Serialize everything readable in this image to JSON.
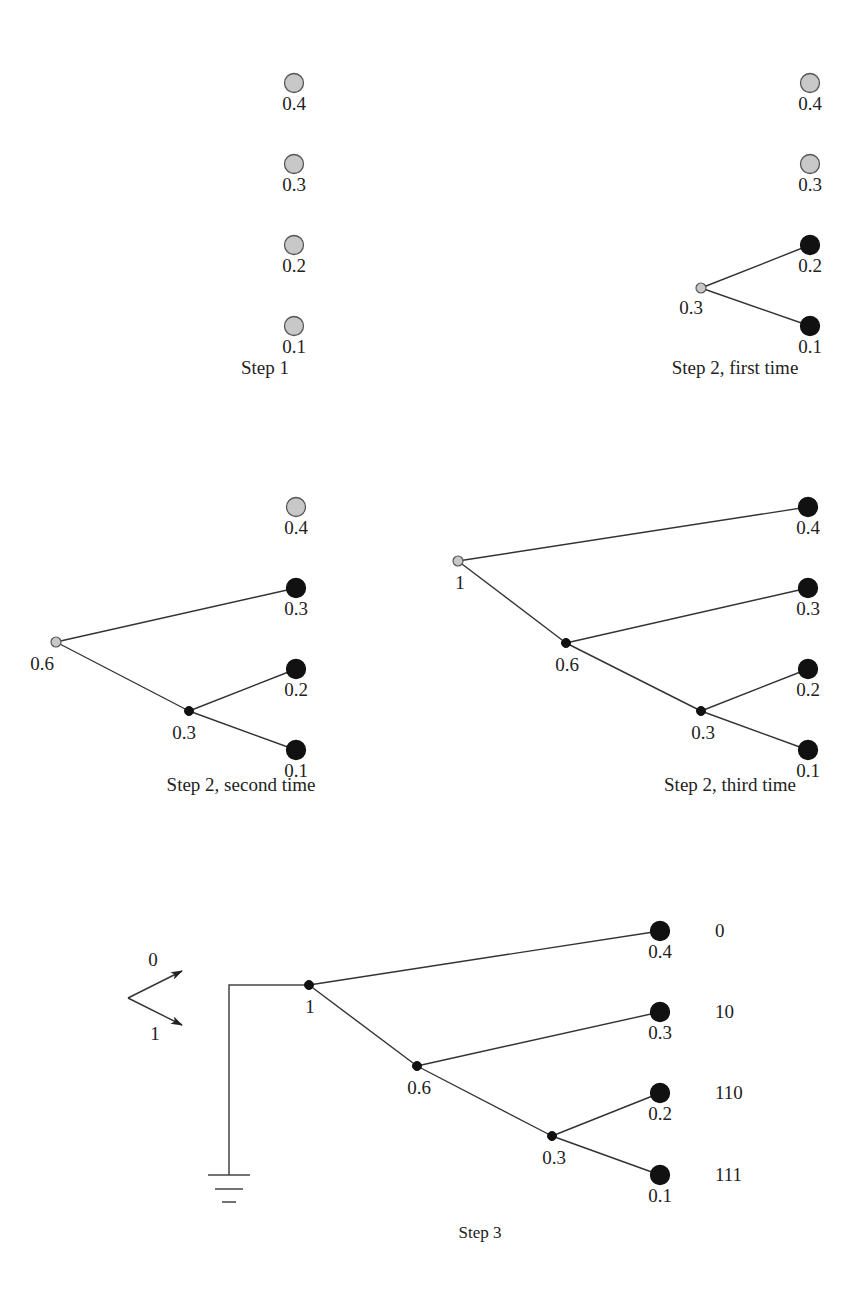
{
  "colors": {
    "pending_fill": "#c8c8c8",
    "pending_stroke": "#555555",
    "done_fill": "#111111",
    "line": "#333333",
    "text": "#222222"
  },
  "header_fragment": "",
  "panels": [
    {
      "id": "step1",
      "caption": "Step 1",
      "caption_pos": [
        265,
        374
      ],
      "leaves": [
        {
          "value": "0.4",
          "x": 294,
          "y": 83,
          "state": "pending"
        },
        {
          "value": "0.3",
          "x": 294,
          "y": 164,
          "state": "pending"
        },
        {
          "value": "0.2",
          "x": 294,
          "y": 245,
          "state": "pending"
        },
        {
          "value": "0.1",
          "x": 294,
          "y": 326,
          "state": "pending"
        }
      ],
      "internal": [],
      "edges": []
    },
    {
      "id": "step2-first",
      "caption": "Step 2, first time",
      "caption_pos": [
        735,
        374
      ],
      "leaves": [
        {
          "value": "0.4",
          "x": 810,
          "y": 83,
          "state": "pending"
        },
        {
          "value": "0.3",
          "x": 810,
          "y": 164,
          "state": "pending"
        },
        {
          "value": "0.2",
          "x": 810,
          "y": 245,
          "state": "done"
        },
        {
          "value": "0.1",
          "x": 810,
          "y": 326,
          "state": "done"
        }
      ],
      "internal": [
        {
          "value": "0.3",
          "x": 701,
          "y": 288,
          "state": "pending",
          "label_dx": -10,
          "label_dy": 26
        }
      ],
      "edges": [
        [
          701,
          288,
          810,
          245
        ],
        [
          701,
          288,
          810,
          326
        ]
      ]
    },
    {
      "id": "step2-second",
      "caption": "Step 2, second time",
      "caption_pos": [
        241,
        791
      ],
      "leaves": [
        {
          "value": "0.4",
          "x": 296,
          "y": 507,
          "state": "pending"
        },
        {
          "value": "0.3",
          "x": 296,
          "y": 588,
          "state": "done"
        },
        {
          "value": "0.2",
          "x": 296,
          "y": 669,
          "state": "done"
        },
        {
          "value": "0.1",
          "x": 296,
          "y": 750,
          "state": "done"
        }
      ],
      "internal": [
        {
          "value": "0.6",
          "x": 56,
          "y": 642,
          "state": "pending",
          "label_dx": -14,
          "label_dy": 28
        },
        {
          "value": "0.3",
          "x": 189,
          "y": 711,
          "state": "done",
          "label_dx": -5,
          "label_dy": 28
        }
      ],
      "edges": [
        [
          56,
          642,
          296,
          588
        ],
        [
          56,
          642,
          189,
          711
        ],
        [
          189,
          711,
          296,
          669
        ],
        [
          189,
          711,
          296,
          750
        ]
      ]
    },
    {
      "id": "step2-third",
      "caption": "Step 2, third time",
      "caption_pos": [
        730,
        791
      ],
      "leaves": [
        {
          "value": "0.4",
          "x": 808,
          "y": 507,
          "state": "done"
        },
        {
          "value": "0.3",
          "x": 808,
          "y": 588,
          "state": "done"
        },
        {
          "value": "0.2",
          "x": 808,
          "y": 669,
          "state": "done"
        },
        {
          "value": "0.1",
          "x": 808,
          "y": 750,
          "state": "done"
        }
      ],
      "internal": [
        {
          "value": "1",
          "x": 458,
          "y": 561,
          "state": "pending",
          "label_dx": 2,
          "label_dy": 28
        },
        {
          "value": "0.6",
          "x": 566,
          "y": 643,
          "state": "done",
          "label_dx": 1,
          "label_dy": 28
        },
        {
          "value": "0.3",
          "x": 701,
          "y": 711,
          "state": "done",
          "label_dx": 2,
          "label_dy": 28
        }
      ],
      "edges": [
        [
          458,
          561,
          808,
          507
        ],
        [
          458,
          561,
          566,
          643
        ],
        [
          566,
          643,
          808,
          588
        ],
        [
          566,
          643,
          701,
          711
        ],
        [
          701,
          711,
          808,
          669
        ],
        [
          701,
          711,
          808,
          750
        ]
      ]
    },
    {
      "id": "step3",
      "caption": "Step 3",
      "caption_pos": [
        480,
        1238
      ],
      "leaves": [
        {
          "value": "0.4",
          "x": 660,
          "y": 931,
          "state": "done",
          "code": "0"
        },
        {
          "value": "0.3",
          "x": 660,
          "y": 1012,
          "state": "done",
          "code": "10"
        },
        {
          "value": "0.2",
          "x": 660,
          "y": 1093,
          "state": "done",
          "code": "110"
        },
        {
          "value": "0.1",
          "x": 660,
          "y": 1175,
          "state": "done",
          "code": "111"
        }
      ],
      "internal": [
        {
          "value": "1",
          "x": 309,
          "y": 985,
          "state": "done",
          "label_dx": 1,
          "label_dy": 28
        },
        {
          "value": "0.6",
          "x": 417,
          "y": 1066,
          "state": "done",
          "label_dx": 2,
          "label_dy": 28
        },
        {
          "value": "0.3",
          "x": 552,
          "y": 1136,
          "state": "done",
          "label_dx": 2,
          "label_dy": 28
        }
      ],
      "edges": [
        [
          309,
          985,
          660,
          931
        ],
        [
          309,
          985,
          417,
          1066
        ],
        [
          417,
          1066,
          660,
          1012
        ],
        [
          417,
          1066,
          552,
          1136
        ],
        [
          552,
          1136,
          660,
          1093
        ],
        [
          552,
          1136,
          660,
          1175
        ]
      ],
      "code_x": 715,
      "legend": {
        "up_label": "0",
        "down_label": "1",
        "vertex": [
          128,
          998
        ],
        "up_tip": [
          182,
          971
        ],
        "down_tip": [
          182,
          1025
        ],
        "up_label_pos": [
          153,
          966
        ],
        "down_label_pos": [
          155,
          1040
        ]
      },
      "ground": {
        "wire_top_x": 229,
        "wire_top_y": 985,
        "wire_bottom_y": 1175,
        "bars": [
          [
            208,
            250,
            1175
          ],
          [
            215,
            243,
            1189
          ],
          [
            222,
            236,
            1202
          ]
        ]
      }
    }
  ],
  "node_sizes": {
    "leaf_r": 9.5,
    "internal_pending_r": 5,
    "internal_done_r": 4.5
  }
}
